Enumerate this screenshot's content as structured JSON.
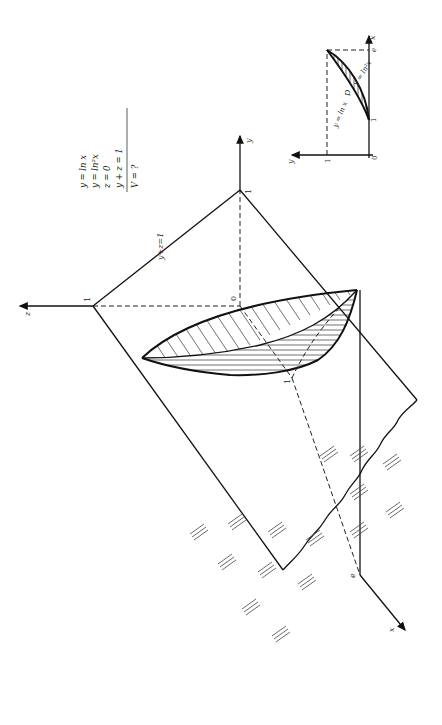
{
  "figure": {
    "orientation": "rotated 90° counter-clockwise",
    "colors": {
      "ink": "#111111",
      "background": "#ffffff"
    }
  },
  "equations": {
    "lines": [
      "y = ln x",
      "y = ln²x",
      "z = 0",
      "y + z = 1"
    ],
    "result": "V = ?"
  },
  "main_3d": {
    "axes": {
      "z_label": "z",
      "y_label": "y",
      "x_label": "x",
      "origin_label": "0"
    },
    "ticks": {
      "z_one": "1",
      "y_one": "1",
      "x_one": "1",
      "x_e": "e"
    },
    "plane_label": "y+z=1"
  },
  "inset_2d": {
    "axes": {
      "x_label": "x",
      "y_label": "y",
      "origin_label": "0"
    },
    "ticks": {
      "x_one": "1",
      "x_e": "e",
      "y_one": "1"
    },
    "curves": {
      "upper": "y = ln x",
      "lower": "y = ln²x"
    },
    "region_label": "D"
  }
}
